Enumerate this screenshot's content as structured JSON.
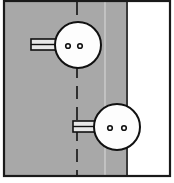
{
  "figure": {
    "canvas": {
      "width": 174,
      "height": 183
    },
    "background_color": "#ffffff",
    "frame": {
      "name": "outer-frame",
      "x": 4,
      "y": 1,
      "width": 166,
      "height": 175,
      "stroke_color": "#1a1a1a",
      "stroke_width": 2.2,
      "fill": "none"
    },
    "panel": {
      "name": "shaded-panel",
      "x": 5,
      "y": 2,
      "width": 122,
      "height": 173,
      "fill_color": "#a8a8a8",
      "edge_color": "#3a3a3a",
      "edge_width": 2
    },
    "blank_area": {
      "name": "unshaded-area",
      "x": 127,
      "y": 2,
      "width": 42,
      "height": 173,
      "fill_color": "#ffffff"
    },
    "center_line": {
      "name": "dashed-center-line",
      "x": 77,
      "y_start": 2,
      "y_end": 175,
      "stroke_color": "#232323",
      "stroke_width": 1.8,
      "dash_pattern": "13 8",
      "style": "dashed"
    },
    "light_guide_line": {
      "name": "light-guide-line",
      "x": 105,
      "y_start": 2,
      "y_end": 175,
      "stroke_color": "#c8c8c8",
      "stroke_width": 1.6,
      "style": "solid"
    },
    "fasteners": [
      {
        "name": "upper-fastener",
        "circle": {
          "cx": 78,
          "cy": 45,
          "r": 23,
          "fill_color": "#fdfdfd",
          "stroke_color": "#111111",
          "stroke_width": 2
        },
        "holes": [
          {
            "name": "upper-hole-left",
            "cx": 68,
            "cy": 46,
            "r": 2.3
          },
          {
            "name": "upper-hole-right",
            "cx": 80,
            "cy": 46,
            "r": 2.3
          }
        ],
        "hole_fill": "#fdfdfd",
        "hole_stroke": "#111111",
        "tab": {
          "name": "upper-tab",
          "x": 31,
          "y": 39,
          "width": 28,
          "height": 11,
          "fill_color": "#e8e8e8",
          "stroke_color": "#111111",
          "stroke_width": 1.6,
          "divider_y": 44.5,
          "divider_color": "#111111",
          "divider_width": 1.4,
          "side": "left"
        }
      },
      {
        "name": "lower-fastener",
        "circle": {
          "cx": 117,
          "cy": 127,
          "r": 23,
          "fill_color": "#fdfdfd",
          "stroke_color": "#111111",
          "stroke_width": 2
        },
        "holes": [
          {
            "name": "lower-hole-left",
            "cx": 110,
            "cy": 128,
            "r": 2.3
          },
          {
            "name": "lower-hole-right",
            "cx": 124,
            "cy": 128,
            "r": 2.3
          }
        ],
        "hole_fill": "#fdfdfd",
        "hole_stroke": "#111111",
        "tab": {
          "name": "lower-tab",
          "x": 73,
          "y": 121,
          "width": 28,
          "height": 11,
          "fill_color": "#e8e8e8",
          "stroke_color": "#111111",
          "stroke_width": 1.6,
          "divider_y": 126.5,
          "divider_color": "#111111",
          "divider_width": 1.4,
          "side": "left"
        }
      }
    ],
    "colors": {
      "panel_gray": "#a8a8a8",
      "outline_black": "#111111",
      "guide_gray": "#c8c8c8",
      "white": "#ffffff"
    }
  }
}
